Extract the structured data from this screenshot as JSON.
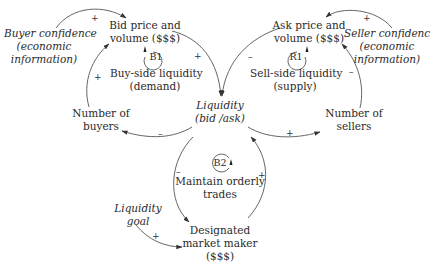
{
  "nodes": {
    "buyer_confidence": {
      "line1": "Buyer confidence",
      "line2": "(economic",
      "line3": "information)"
    },
    "bid_price": {
      "line1": "Bid price and",
      "line2": "volume ($$$)"
    },
    "ask_price": {
      "line1": "Ask price and",
      "line2": "volume ($$$)"
    },
    "seller_confidence": {
      "line1": "Seller confidence",
      "line2": "(economic",
      "line3": "information)"
    },
    "liquidity": {
      "line1": "Liquidity",
      "line2": "(bid /ask)"
    },
    "number_of_buyers": {
      "line1": "Number of",
      "line2": "buyers"
    },
    "number_of_sellers": {
      "line1": "Number of",
      "line2": "sellers"
    },
    "liquidity_goal": {
      "line1": "Liquidity",
      "line2": "goal"
    },
    "designated_market_maker": {
      "line1": "Designated",
      "line2": "market maker",
      "line3": "($$$)"
    }
  },
  "loops": {
    "b1": {
      "id": "B1",
      "line1": "Buy-side liquidity",
      "line2": "(demand)"
    },
    "r1": {
      "id": "R1",
      "line1": "Sell-side liquidity",
      "line2": "(supply)"
    },
    "b2": {
      "id": "B2",
      "line1": "Maintain orderly",
      "line2": "trades"
    }
  },
  "links": {
    "buyer_conf_to_bid": "+",
    "seller_conf_to_ask": "+",
    "bid_to_liquidity": "+",
    "ask_to_liquidity": "–",
    "liquidity_to_buyers": "–",
    "liquidity_to_sellers": "+",
    "buyers_to_bid": "+",
    "sellers_to_ask": "–",
    "liquidity_to_dmm": "–",
    "dmm_to_liquidity": "+",
    "goal_to_dmm": "+"
  },
  "colors": {
    "line": "#444444",
    "text": "#2a2a2a"
  }
}
